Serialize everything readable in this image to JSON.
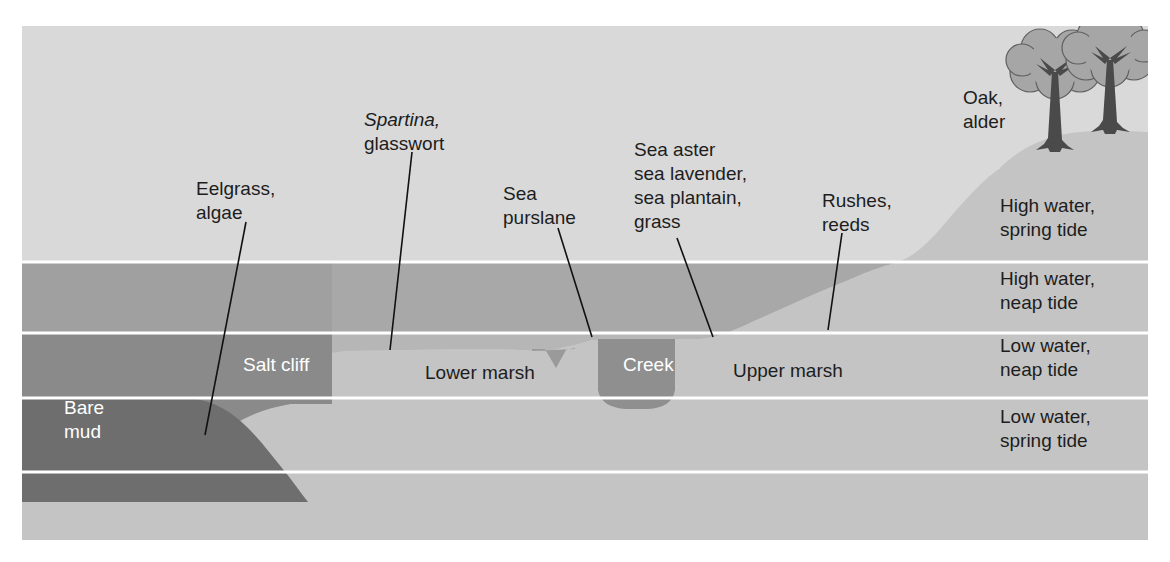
{
  "figure": {
    "frame": {
      "x": 22,
      "y": 26,
      "width": 1126,
      "height": 514
    }
  },
  "colors": {
    "page_background": "#ffffff",
    "sky": "#d9d9d9",
    "band_high_spring": "#d9d9d9",
    "band_high_neap": "#a8a8a8",
    "band_low_neap": "#b4b4b4",
    "band_low_spring": "#b4b4b4",
    "band_below": "#b0b0b0",
    "terrain_light": "#c4c4c4",
    "terrain_mid": "#a0a0a0",
    "terrain_dark": "#777777",
    "bare_mud": "#6e6e6e",
    "creek": "#8f8f8f",
    "tree_canopy": "#a6a6a6",
    "tree_trunk": "#4a4a4a",
    "separator_line": "#ffffff",
    "leader_line": "#111111",
    "text_dark": "#1d1d1d",
    "text_light": "#ffffff"
  },
  "tide_levels": [
    {
      "id": "high-water-spring-tide",
      "line1": "High water,",
      "line2": "spring tide",
      "x": 1000,
      "y": 212
    },
    {
      "id": "high-water-neap-tide",
      "line1": "High water,",
      "line2": "neap tide",
      "x": 1000,
      "y": 285
    },
    {
      "id": "low-water-neap-tide",
      "line1": "Low water,",
      "line2": "neap tide",
      "x": 1000,
      "y": 352
    },
    {
      "id": "low-water-spring-tide",
      "line1": "Low water,",
      "line2": "spring tide",
      "x": 1000,
      "y": 423
    }
  ],
  "zone_labels": [
    {
      "id": "bare-mud",
      "line1": "Bare",
      "line2": "mud",
      "x": 64,
      "y": 414,
      "color": "light"
    },
    {
      "id": "salt-cliff",
      "line1": "Salt cliff",
      "line2": "",
      "x": 243,
      "y": 371,
      "color": "light"
    },
    {
      "id": "lower-marsh",
      "line1": "Lower marsh",
      "line2": "",
      "x": 425,
      "y": 379,
      "color": "dark"
    },
    {
      "id": "creek",
      "line1": "Creek",
      "line2": "",
      "x": 623,
      "y": 371,
      "color": "light"
    },
    {
      "id": "upper-marsh",
      "line1": "Upper marsh",
      "line2": "",
      "x": 733,
      "y": 377,
      "color": "dark"
    }
  ],
  "species_callouts": [
    {
      "id": "eelgrass-algae",
      "lines": [
        "Eelgrass,",
        "algae"
      ],
      "italic_first_word": false,
      "text_x": 196,
      "text_y": 195,
      "leader": {
        "x1": 246,
        "y1": 222,
        "x2": 205,
        "y2": 435
      }
    },
    {
      "id": "spartina-glasswort",
      "lines": [
        "Spartina,",
        "glasswort"
      ],
      "italic_first_word": true,
      "text_x": 364,
      "text_y": 126,
      "leader": {
        "x1": 412,
        "y1": 152,
        "x2": 390,
        "y2": 350
      }
    },
    {
      "id": "sea-purslane",
      "lines": [
        "Sea",
        "purslane"
      ],
      "italic_first_word": false,
      "text_x": 503,
      "text_y": 200,
      "leader": {
        "x1": 558,
        "y1": 228,
        "x2": 592,
        "y2": 337
      }
    },
    {
      "id": "sea-aster-group",
      "lines": [
        "Sea aster",
        "sea lavender,",
        "sea plantain,",
        "grass"
      ],
      "italic_first_word": false,
      "text_x": 634,
      "text_y": 156,
      "leader": {
        "x1": 677,
        "y1": 238,
        "x2": 713,
        "y2": 337
      }
    },
    {
      "id": "rushes-reeds",
      "lines": [
        "Rushes,",
        "reeds"
      ],
      "italic_first_word": false,
      "text_x": 822,
      "text_y": 207,
      "leader": {
        "x1": 842,
        "y1": 233,
        "x2": 828,
        "y2": 330
      }
    },
    {
      "id": "oak-alder",
      "lines": [
        "Oak,",
        "alder"
      ],
      "italic_first_word": false,
      "text_x": 963,
      "text_y": 104,
      "leader": null
    }
  ]
}
